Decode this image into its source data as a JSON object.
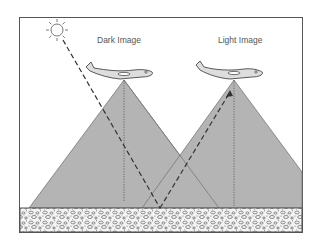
{
  "diagram": {
    "labels": {
      "dark": "Dark Image",
      "light": "Light Image"
    },
    "elements": {
      "sun": "sun-icon",
      "aircraft_left": "airplane-icon",
      "aircraft_right": "airplane-icon",
      "ground": "textured-ground"
    },
    "colors": {
      "cone_fill": "#b4b4b4",
      "frame": "#555555",
      "ray": "#333333",
      "ground_bg": "#f2f2f2"
    }
  }
}
